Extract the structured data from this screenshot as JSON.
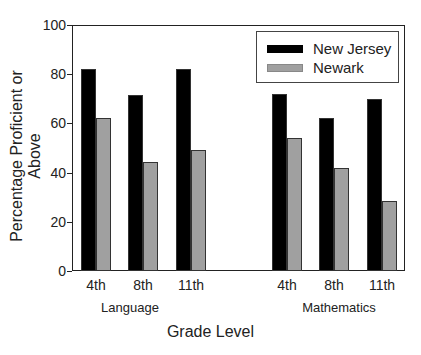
{
  "chart_data": {
    "type": "bar",
    "title": "",
    "xlabel": "Grade Level",
    "ylabel": "Percentage Proficient or Above",
    "ylim": [
      0,
      100
    ],
    "yticks": [
      0,
      20,
      40,
      60,
      80,
      100
    ],
    "grid": false,
    "legend_position": "upper right",
    "groups": [
      {
        "name": "Language",
        "categories": [
          "4th",
          "8th",
          "11th"
        ]
      },
      {
        "name": "Mathematics",
        "categories": [
          "4th",
          "8th",
          "11th"
        ]
      }
    ],
    "categories": [
      "Language 4th",
      "Language 8th",
      "Language 11th",
      "Mathematics 4th",
      "Mathematics 8th",
      "Mathematics 11th"
    ],
    "series": [
      {
        "name": "New Jersey",
        "color": "#000000",
        "values": [
          82,
          71.5,
          82,
          72,
          62,
          70
        ]
      },
      {
        "name": "Newark",
        "color": "#a0a0a0",
        "values": [
          62,
          44.5,
          49,
          54,
          42,
          28.5
        ]
      }
    ]
  },
  "labels": {
    "ylabel": "Percentage Proficient or Above",
    "xlabel": "Grade Level",
    "yticks": [
      "0",
      "20",
      "40",
      "60",
      "80",
      "100"
    ],
    "cats": [
      "4th",
      "8th",
      "11th",
      "4th",
      "8th",
      "11th"
    ],
    "group_language": "Language",
    "group_math": "Mathematics",
    "legend_nj": "New Jersey",
    "legend_newark": "Newark"
  }
}
